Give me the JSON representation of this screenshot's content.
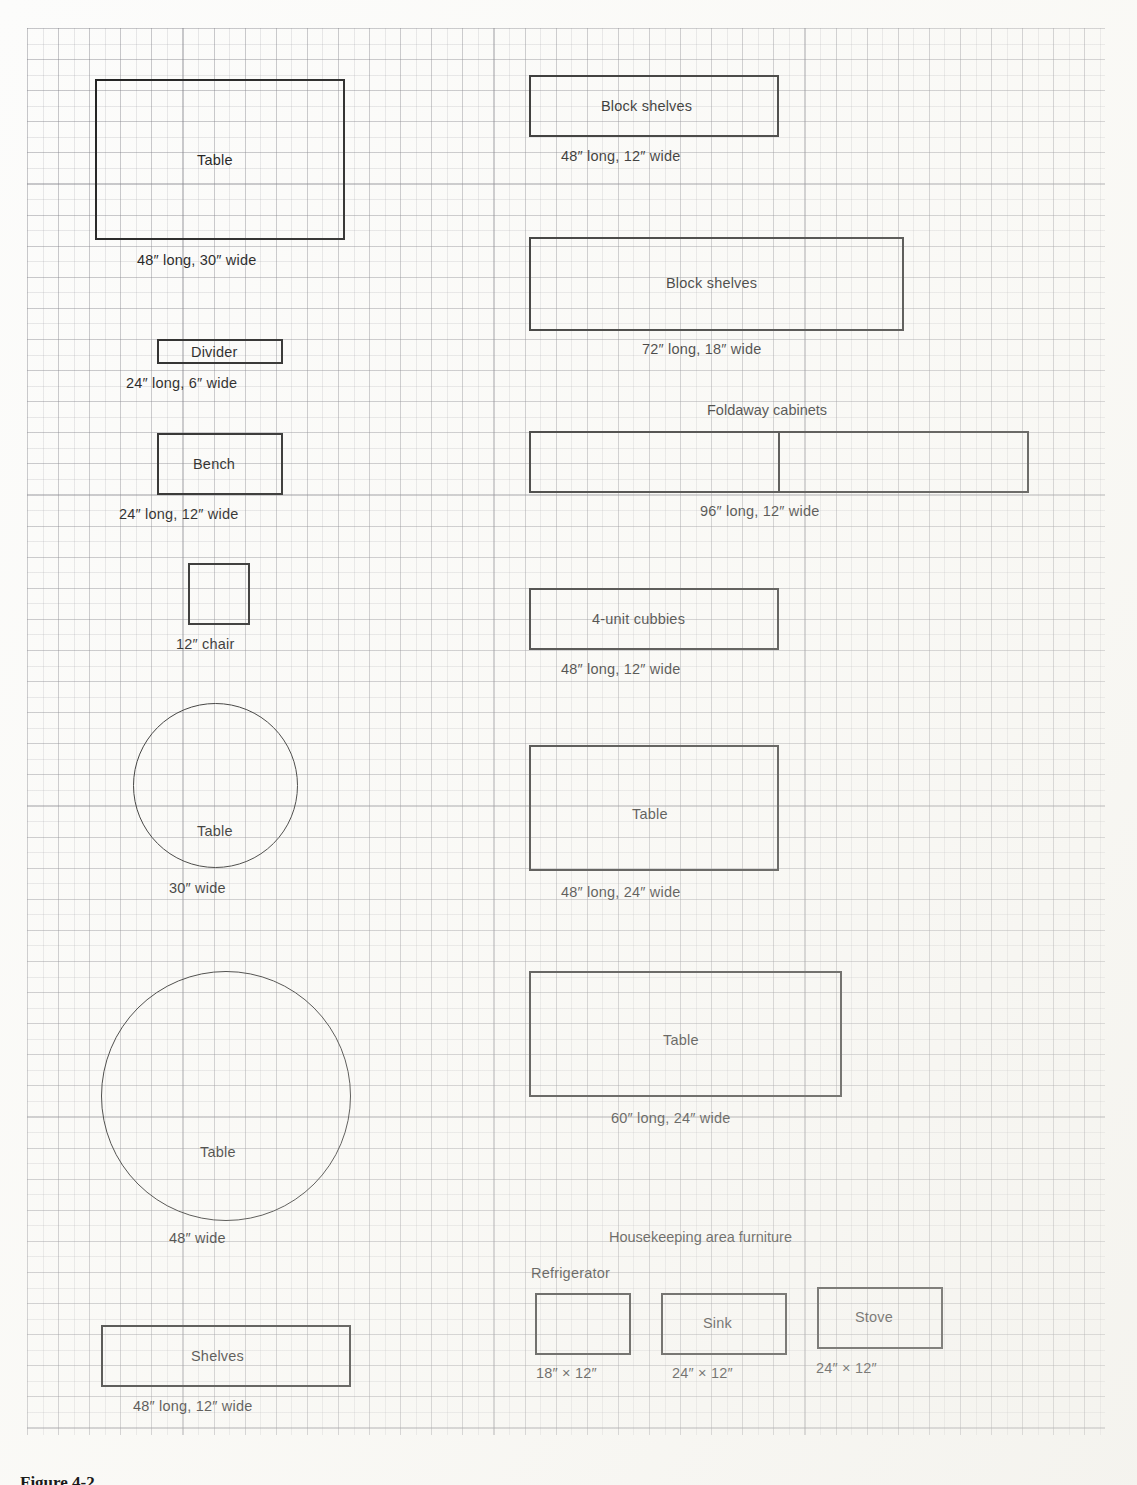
{
  "figure": {
    "bottom_caption": "Figure 4-2"
  },
  "grid": {
    "major_spacing_px": 31,
    "minor_spacing_px": 15.5,
    "line_color": "#78787f"
  },
  "left_column": {
    "items": [
      {
        "label": "Table",
        "caption": "48″ long, 30″ wide",
        "shape": "rect",
        "dims": "48x30"
      },
      {
        "label": "Divider",
        "caption": "24″ long, 6″ wide",
        "shape": "rect",
        "dims": "24x6"
      },
      {
        "label": "Bench",
        "caption": "24″ long, 12″ wide",
        "shape": "rect",
        "dims": "24x12"
      },
      {
        "label": "",
        "caption": "12″ chair",
        "shape": "square",
        "dims": "12x12"
      },
      {
        "label": "Table",
        "caption": "30″ wide",
        "shape": "circle",
        "dims": "d30"
      },
      {
        "label": "Table",
        "caption": "48″ wide",
        "shape": "circle",
        "dims": "d48"
      },
      {
        "label": "Shelves",
        "caption": "48″ long, 12″ wide",
        "shape": "rect",
        "dims": "48x12"
      }
    ]
  },
  "right_column": {
    "items": [
      {
        "label": "Block shelves",
        "caption": "48″ long, 12″ wide",
        "shape": "rect",
        "dims": "48x12"
      },
      {
        "label": "Block shelves",
        "caption": "72″ long, 18″ wide",
        "shape": "rect",
        "dims": "72x18"
      },
      {
        "label": "",
        "caption": "96″ long, 12″ wide",
        "shape": "rect-split",
        "dims": "96x12",
        "group_title": "Foldaway cabinets"
      },
      {
        "label": "4-unit cubbies",
        "caption": "48″ long, 12″ wide",
        "shape": "rect",
        "dims": "48x12"
      },
      {
        "label": "Table",
        "caption": "48″ long, 24″ wide",
        "shape": "rect",
        "dims": "48x24"
      },
      {
        "label": "Table",
        "caption": "60″ long, 24″ wide",
        "shape": "rect",
        "dims": "60x24"
      }
    ]
  },
  "housekeeping": {
    "group_title": "Housekeeping area furniture",
    "items": [
      {
        "label": "Refrigerator",
        "label_position": "above",
        "caption": "18″ × 12″",
        "dims": "18x12"
      },
      {
        "label": "Sink",
        "label_position": "inside",
        "caption": "24″ × 12″",
        "dims": "24x12"
      },
      {
        "label": "Stove",
        "label_position": "inside",
        "caption": "24″ × 12″",
        "dims": "24x12"
      }
    ]
  }
}
